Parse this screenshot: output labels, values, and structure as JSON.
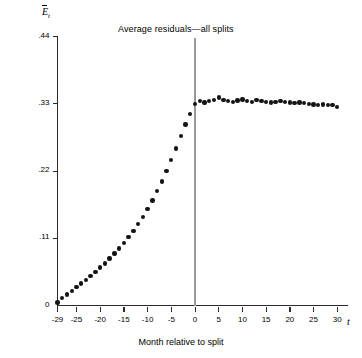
{
  "figure": {
    "title": "Average residuals—all splits",
    "y_axis_symbol_base": "E",
    "y_axis_symbol_sub": "t",
    "y_axis_title": "Cumulative average excess return",
    "x_axis_title": "Month relative to split",
    "x_axis_symbol": "t",
    "event_line_label": "split-month-0",
    "colors": {
      "point": "#141414",
      "axis": "#2b2b2b",
      "event_line": "#9a9a9a",
      "background": "#ffffff"
    }
  },
  "chart_data": {
    "type": "scatter",
    "title": "Average residuals—all splits",
    "xlabel": "Month relative to split",
    "ylabel": "Cumulative average excess return",
    "xlim": [
      -29,
      31
    ],
    "ylim": [
      0,
      0.44
    ],
    "grid": false,
    "legend": null,
    "xticks": [
      -29,
      -25,
      -20,
      -15,
      -10,
      -5,
      0,
      5,
      10,
      15,
      20,
      25,
      30
    ],
    "xtick_labels": [
      "-29",
      "-25",
      "-20",
      "-15",
      "-10",
      "-5",
      "0",
      "5",
      "10",
      "15",
      "20",
      "25",
      "30"
    ],
    "yticks": [
      0,
      0.11,
      0.22,
      0.33,
      0.44
    ],
    "ytick_labels": [
      "0",
      ".11",
      ".22",
      ".33",
      ".44"
    ],
    "annotations": [
      {
        "type": "vline",
        "x": 0,
        "label": "split month"
      }
    ],
    "x": [
      -29,
      -28,
      -27,
      -26,
      -25,
      -24,
      -23,
      -22,
      -21,
      -20,
      -19,
      -18,
      -17,
      -16,
      -15,
      -14,
      -13,
      -12,
      -11,
      -10,
      -9,
      -8,
      -7,
      -6,
      -5,
      -4,
      -3,
      -2,
      -1,
      0,
      1,
      2,
      3,
      4,
      5,
      6,
      7,
      8,
      9,
      10,
      11,
      12,
      13,
      14,
      15,
      16,
      17,
      18,
      19,
      20,
      21,
      22,
      23,
      24,
      25,
      26,
      27,
      28,
      29,
      30
    ],
    "y": [
      0.005,
      0.012,
      0.018,
      0.024,
      0.03,
      0.036,
      0.042,
      0.048,
      0.055,
      0.062,
      0.069,
      0.077,
      0.085,
      0.093,
      0.102,
      0.112,
      0.122,
      0.133,
      0.145,
      0.158,
      0.172,
      0.187,
      0.203,
      0.22,
      0.238,
      0.257,
      0.277,
      0.296,
      0.313,
      0.33,
      0.334,
      0.332,
      0.334,
      0.336,
      0.34,
      0.336,
      0.334,
      0.333,
      0.335,
      0.337,
      0.334,
      0.333,
      0.336,
      0.334,
      0.333,
      0.332,
      0.333,
      0.334,
      0.333,
      0.332,
      0.331,
      0.332,
      0.331,
      0.33,
      0.329,
      0.328,
      0.329,
      0.328,
      0.328,
      0.325
    ]
  }
}
